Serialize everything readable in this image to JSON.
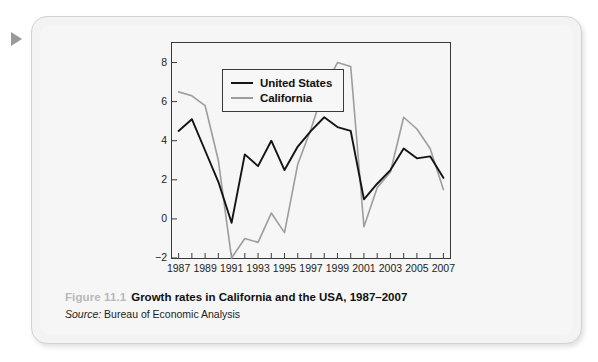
{
  "panel": {
    "pointer_icon": "triangle-right-marker"
  },
  "caption": {
    "figure_number": "Figure 11.1",
    "title": "Growth rates in California and the USA, 1987–2007",
    "source_label": "Source:",
    "source_value": "Bureau of Economic Analysis"
  },
  "colors": {
    "united_states": "#141414",
    "california": "#9d9d9d",
    "frame": "#3a3a3a",
    "panel_bg": "#f3f3f3",
    "plot_bg": "#f6f6f6",
    "figure_number": "#b8b8b8"
  },
  "chart_data": {
    "type": "line",
    "title": "Growth rates in California and the USA, 1987–2007",
    "xlabel": "",
    "ylabel": "",
    "grid": false,
    "legend_position": "top-left",
    "xlim": [
      1986.5,
      2007.5
    ],
    "ylim": [
      -2,
      9
    ],
    "yticks": [
      -2,
      0,
      2,
      4,
      6,
      8
    ],
    "ytick_labels": [
      "−2",
      "0",
      "2",
      "4",
      "6",
      "8"
    ],
    "x": [
      1987,
      1988,
      1989,
      1990,
      1991,
      1992,
      1993,
      1994,
      1995,
      1996,
      1997,
      1998,
      1999,
      2000,
      2001,
      2002,
      2003,
      2004,
      2005,
      2006,
      2007
    ],
    "xticks": [
      1987,
      1989,
      1991,
      1993,
      1995,
      1997,
      1999,
      2001,
      2003,
      2005,
      2007
    ],
    "xtick_labels": [
      "1987",
      "1989",
      "1991",
      "1993",
      "1995",
      "1997",
      "1999",
      "2001",
      "2003",
      "2005",
      "2007"
    ],
    "series": [
      {
        "name": "United States",
        "color": "#141414",
        "values": [
          4.5,
          5.1,
          3.5,
          1.9,
          -0.2,
          3.3,
          2.7,
          4.0,
          2.5,
          3.7,
          4.5,
          5.2,
          4.7,
          4.5,
          1.0,
          1.8,
          2.5,
          3.6,
          3.1,
          3.2,
          2.1
        ]
      },
      {
        "name": "California",
        "color": "#9d9d9d",
        "values": [
          6.5,
          6.3,
          5.8,
          3.0,
          -2.0,
          -1.0,
          -1.2,
          0.3,
          -0.7,
          2.8,
          4.6,
          6.7,
          8.0,
          7.8,
          -0.4,
          1.6,
          2.4,
          5.2,
          4.6,
          3.6,
          1.5
        ]
      }
    ]
  }
}
